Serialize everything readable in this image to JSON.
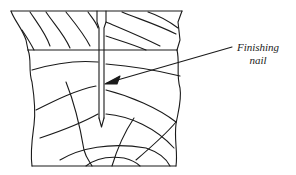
{
  "diagram": {
    "title": "",
    "parts": [
      {
        "name": "top-board",
        "description": "upper wood piece with diagonal grain"
      },
      {
        "name": "lower-block",
        "description": "lower wood piece with end grain rings"
      },
      {
        "name": "nail",
        "description": "finishing nail driven through top board into lower block"
      }
    ],
    "callout": {
      "line1": "Finishing",
      "line2": "nail"
    },
    "colors": {
      "ink": "#1a1a1a",
      "background": "#ffffff"
    }
  }
}
